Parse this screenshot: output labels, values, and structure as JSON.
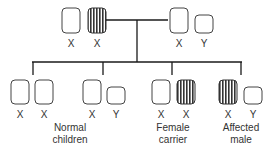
{
  "diagram": {
    "colors": {
      "line": "#1a1a1a",
      "normal_fill": "#ffffff",
      "affected_fill": "#555555"
    },
    "parents": {
      "mother": {
        "chromosomes": [
          {
            "label": "X",
            "affected": false
          },
          {
            "label": "X",
            "affected": true
          }
        ]
      },
      "father": {
        "chromosomes": [
          {
            "label": "X",
            "affected": false
          },
          {
            "label": "Y",
            "affected": false
          }
        ]
      }
    },
    "children": [
      {
        "id": "daughter-normal",
        "chromosomes": [
          {
            "label": "X",
            "affected": false
          },
          {
            "label": "X",
            "affected": false
          }
        ]
      },
      {
        "id": "son-normal",
        "chromosomes": [
          {
            "label": "X",
            "affected": false
          },
          {
            "label": "Y",
            "affected": false
          }
        ]
      },
      {
        "id": "daughter-carrier",
        "chromosomes": [
          {
            "label": "X",
            "affected": false
          },
          {
            "label": "X",
            "affected": true
          }
        ]
      },
      {
        "id": "son-affected",
        "chromosomes": [
          {
            "label": "X",
            "affected": true
          },
          {
            "label": "Y",
            "affected": false
          }
        ]
      }
    ],
    "captions": {
      "normal": [
        "Normal",
        "children"
      ],
      "carrier": [
        "Female",
        "carrier"
      ],
      "affected": [
        "Affected",
        "male"
      ]
    }
  }
}
